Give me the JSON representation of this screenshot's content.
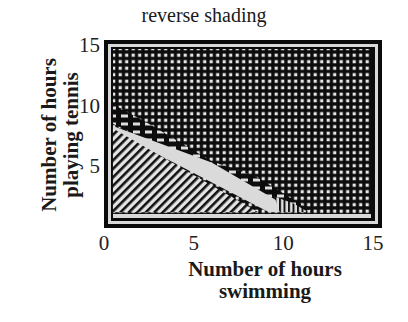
{
  "chart_data": {
    "type": "heatmap",
    "title": "reverse shading",
    "xlabel_lines": [
      "Number of hours",
      "swimming"
    ],
    "ylabel_lines": [
      "Number of hours",
      "playing tennis"
    ],
    "xlim": [
      0,
      15.5
    ],
    "ylim": [
      0,
      15.5
    ],
    "xticks": [
      "0",
      "5",
      "10",
      "15"
    ],
    "yticks": [
      "5",
      "10",
      "15"
    ],
    "regions": [
      {
        "name": "dark-dotted",
        "pattern": "dense dots on black",
        "description": "high values: upper-right region above line tennis ≈ 10 - swimming"
      },
      {
        "name": "dark-band",
        "pattern": "dashed black band",
        "description": "transition band along tennis ≈ 9 - 0.9*swimming"
      },
      {
        "name": "diagonal-hatch",
        "pattern": "diagonal stripes",
        "description": "low region: lower-left triangle below tennis ≈ 8 - swimming"
      },
      {
        "name": "light-band",
        "pattern": "solid light gray",
        "description": "narrow light strip between swimming ≈ 6 and 10 near bottom"
      },
      {
        "name": "vertical-hatch",
        "pattern": "vertical stripes",
        "description": "small region near swimming ≈ 9.5 - 11, tennis ≈ 1 - 3"
      }
    ],
    "grid": false,
    "legend": "none"
  }
}
